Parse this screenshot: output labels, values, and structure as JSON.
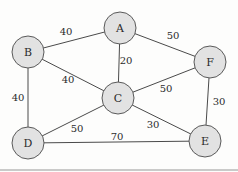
{
  "diagram": {
    "type": "weighted-undirected-graph",
    "nodes": [
      {
        "id": "A",
        "label": "A",
        "x": 120,
        "y": 28
      },
      {
        "id": "B",
        "label": "B",
        "x": 28,
        "y": 52
      },
      {
        "id": "C",
        "label": "C",
        "x": 118,
        "y": 98
      },
      {
        "id": "F",
        "label": "F",
        "x": 210,
        "y": 62
      },
      {
        "id": "D",
        "label": "D",
        "x": 28,
        "y": 143
      },
      {
        "id": "E",
        "label": "E",
        "x": 205,
        "y": 141
      }
    ],
    "edges": [
      {
        "from": "A",
        "to": "B",
        "weight": "40",
        "lx": 66,
        "ly": 31
      },
      {
        "from": "A",
        "to": "C",
        "weight": "20",
        "lx": 126,
        "ly": 60
      },
      {
        "from": "A",
        "to": "F",
        "weight": "50",
        "lx": 173,
        "ly": 35
      },
      {
        "from": "B",
        "to": "C",
        "weight": "40",
        "lx": 68,
        "ly": 79
      },
      {
        "from": "B",
        "to": "D",
        "weight": "40",
        "lx": 18,
        "ly": 97
      },
      {
        "from": "C",
        "to": "F",
        "weight": "50",
        "lx": 166,
        "ly": 88
      },
      {
        "from": "C",
        "to": "D",
        "weight": "50",
        "lx": 77,
        "ly": 128
      },
      {
        "from": "C",
        "to": "E",
        "weight": "30",
        "lx": 153,
        "ly": 124
      },
      {
        "from": "D",
        "to": "E",
        "weight": "70",
        "lx": 117,
        "ly": 136
      },
      {
        "from": "F",
        "to": "E",
        "weight": "30",
        "lx": 219,
        "ly": 101
      }
    ],
    "node_radius": 16,
    "colors": {
      "node_fill": "#e2e2e2",
      "node_stroke": "#5a5a5a",
      "edge": "#4a4a4a",
      "text": "#2b2b2b",
      "background": "#fdfdfc"
    }
  }
}
